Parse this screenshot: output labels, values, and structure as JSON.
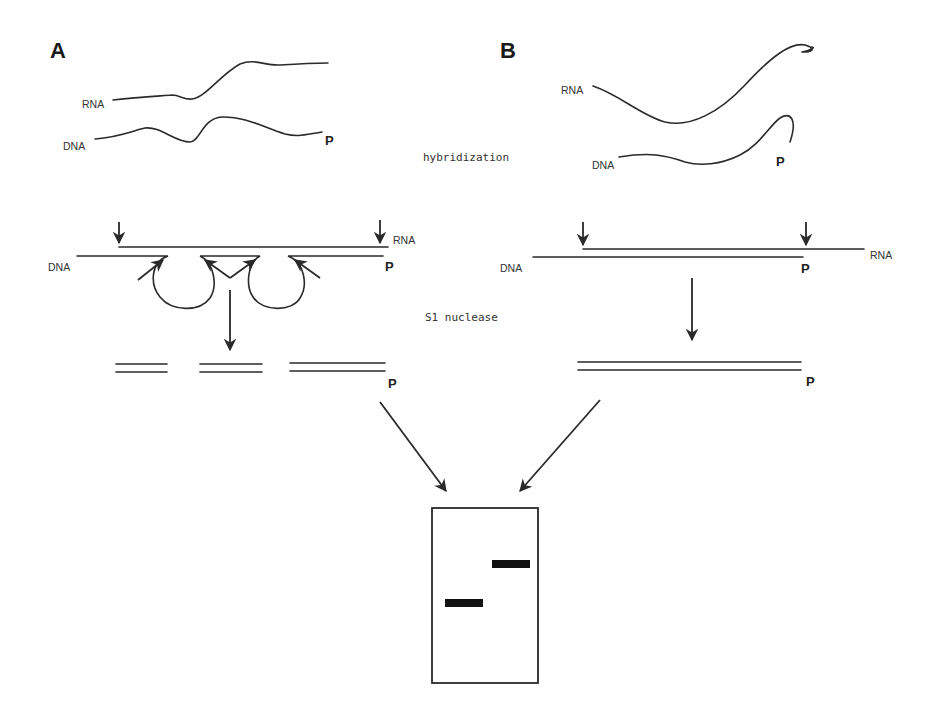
{
  "figure": {
    "panels": [
      {
        "id": "A",
        "label": "A",
        "strand_labels": {
          "rna_top": "RNA",
          "dna_top": "DNA",
          "p_top": "P",
          "rna_hybrid": "RNA",
          "dna_hybrid": "DNA",
          "p_hybrid": "P",
          "p_products": "P"
        }
      },
      {
        "id": "B",
        "label": "B",
        "strand_labels": {
          "rna_top": "RNA",
          "dna_top": "DNA",
          "p_top": "P",
          "rna_hybrid": "RNA",
          "dna_hybrid": "DNA",
          "p_hybrid": "P",
          "p_products": "P"
        }
      }
    ],
    "steps": {
      "step1": "hybridization",
      "step2": "S1 nuclease"
    },
    "gel": {
      "lanes": 2,
      "bands": [
        {
          "lane": "A",
          "position": "lower"
        },
        {
          "lane": "B",
          "position": "upper"
        }
      ]
    },
    "colors": {
      "line": "#2a2a2a",
      "band": "#111111",
      "background": "#ffffff"
    }
  }
}
